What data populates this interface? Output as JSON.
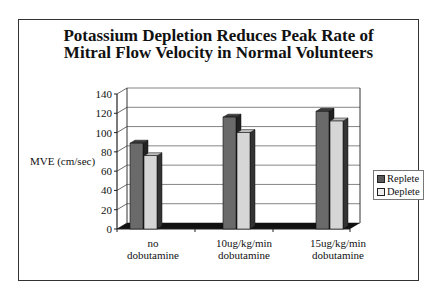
{
  "chart_data": {
    "type": "bar",
    "title": "Potassium Depletion Reduces Peak Rate of Mitral Flow Velocity in Normal Volunteers",
    "title_lines": [
      "Potassium Depletion Reduces Peak Rate of",
      "Mitral Flow Velocity in Normal Volunteers"
    ],
    "xlabel": "",
    "ylabel": "MVE (cm/sec)",
    "ylim": [
      0,
      140
    ],
    "yticks": [
      0,
      20,
      40,
      60,
      80,
      100,
      120,
      140
    ],
    "grid": true,
    "legend_position": "right",
    "categories": [
      "no dobutamine",
      "10ug/kg/min dobutamine",
      "15ug/kg/min dobutamine"
    ],
    "category_lines": [
      [
        "no",
        "dobutamine"
      ],
      [
        "10ug/kg/min",
        "dobutamine"
      ],
      [
        "15ug/kg/min",
        "dobutamine"
      ]
    ],
    "series": [
      {
        "name": "Replete",
        "values": [
          89,
          116,
          122
        ],
        "color": "#5a5a5a"
      },
      {
        "name": "Deplete",
        "values": [
          76,
          100,
          112
        ],
        "color": "#d4d4d4"
      }
    ]
  }
}
